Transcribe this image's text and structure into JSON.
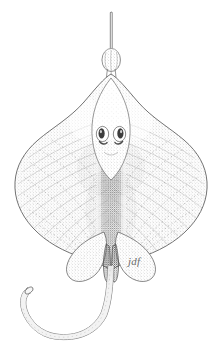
{
  "figure": {
    "kind": "scientific-illustration",
    "medium": "pen-and-ink stipple drawing",
    "orientation": "dorsal, head up, tail down and curving to the left",
    "background_color": "#ffffff",
    "ink_color": "#4a4a4a",
    "stipple_color": "#8a8a8a",
    "outline_color": "#555555",
    "canvas": {
      "width": 222,
      "height": 348
    }
  },
  "signature": {
    "text": "jdf",
    "position": {
      "x": 128,
      "y": 256
    },
    "color": "#6e6e6e"
  },
  "anatomy": {
    "parts": [
      {
        "name": "rostrum-tip",
        "label": "Rostrum tip",
        "note": "slender needle-like point at top"
      },
      {
        "name": "rostral-bulb",
        "label": "Rostral bulb",
        "note": "oval swelling partway down the snout"
      },
      {
        "name": "rostral-shaft",
        "label": "Rostral shaft",
        "note": "narrow stalk joining bulb to disc apex"
      },
      {
        "name": "pectoral-disc",
        "label": "Pectoral disc",
        "note": "broad kite-shaped body formed by fused pectoral fins"
      },
      {
        "name": "left-wing",
        "label": "Left pectoral wing",
        "note": "rounded wing tip with radiating fin-ray lines"
      },
      {
        "name": "right-wing",
        "label": "Right pectoral wing",
        "note": "rounded wing tip with radiating fin-ray lines"
      },
      {
        "name": "left-eye",
        "label": "Left eye",
        "note": "dark oval orbit"
      },
      {
        "name": "right-eye",
        "label": "Right eye",
        "note": "dark oval orbit"
      },
      {
        "name": "left-spiracle",
        "label": "Left spiracle",
        "note": "crescent opening behind the eye"
      },
      {
        "name": "right-spiracle",
        "label": "Right spiracle",
        "note": "crescent opening behind the eye"
      },
      {
        "name": "midline-ridge",
        "label": "Dorsal midline ridge",
        "note": "densely stippled vertebral band down the centre"
      },
      {
        "name": "left-pelvic-fin",
        "label": "Left pelvic fin",
        "note": "lobed fin at rear of disc"
      },
      {
        "name": "right-pelvic-fin",
        "label": "Right pelvic fin",
        "note": "lobed fin at rear of disc"
      },
      {
        "name": "claspers",
        "label": "Claspers",
        "note": "paired male organs between the pelvic fins"
      },
      {
        "name": "tail",
        "label": "Tail",
        "note": "long whip-like tail sweeping left"
      },
      {
        "name": "tail-tip",
        "label": "Tail tip",
        "note": "slightly flattened rounded end"
      }
    ]
  }
}
